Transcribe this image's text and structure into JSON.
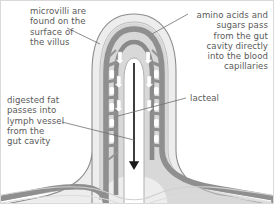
{
  "diagram": {
    "background_color": "#ffffff",
    "labels": {
      "microvilli": "microvilli are\nfound on the\nsurface of\nthe villus",
      "amino_acids": "amino acids and\nsugars pass\nfrom the gut\ncavity directly\ninto the blood\ncapillaries",
      "digested_fat": "digested fat\npasses into\nlymph vessel\nfrom the\ngut cavity",
      "lacteal": "lacteal"
    },
    "colors": {
      "text": "#5a5a5a",
      "leader_line": "#707070",
      "outline": "#8c8c8c",
      "epithelium_fill": "#ededed",
      "mid_grey": "#bdbdbd",
      "capillary_grey": "#9a9a9a",
      "dark_grey": "#8a8a8a",
      "lacteal_fill": "#ffffff",
      "arrow_black": "#1a1a1a",
      "frame": "#d9d9d9"
    },
    "structures": [
      "outer epithelium layer",
      "microvilli surface",
      "blood capillary network",
      "central lacteal lymph vessel",
      "downward lymph flow arrow",
      "white absorption arrows"
    ],
    "arrows": {
      "lacteal_flow_direction": "down",
      "absorption_arrows_direction": "outward"
    }
  }
}
